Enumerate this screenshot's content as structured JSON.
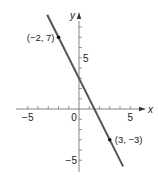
{
  "chart_data": {
    "type": "line",
    "title": "",
    "xlabel": "x",
    "ylabel": "y",
    "xlim": [
      -7,
      7
    ],
    "ylim": [
      -6.5,
      9.5
    ],
    "grid": false,
    "x_ticks": [
      -5,
      -4,
      -3,
      -2,
      -1,
      1,
      2,
      3,
      4,
      5
    ],
    "y_ticks": [
      -5,
      -4,
      -3,
      -2,
      -1,
      1,
      2,
      3,
      4,
      5,
      6,
      7,
      8
    ],
    "x_tick_labels": [
      {
        "value": -5,
        "label": "−5"
      },
      {
        "value": 0,
        "label": "0"
      },
      {
        "value": 5,
        "label": "5"
      }
    ],
    "y_tick_labels": [
      {
        "value": 5,
        "label": "5"
      },
      {
        "value": -5,
        "label": "−5"
      }
    ],
    "series": [
      {
        "name": "line",
        "equation": "y = -2x + 3",
        "x": [
          -3.1,
          4.3
        ],
        "y": [
          9.2,
          -5.6
        ],
        "color": "#555555"
      }
    ],
    "points": [
      {
        "x": -2,
        "y": 7,
        "label": "(−2, 7)",
        "label_side": "left"
      },
      {
        "x": 3,
        "y": -3,
        "label": "(3, −3)",
        "label_side": "right"
      }
    ]
  }
}
